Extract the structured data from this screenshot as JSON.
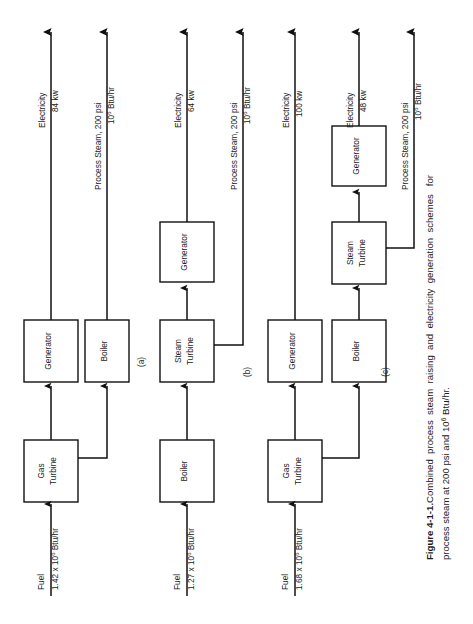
{
  "figure": {
    "number": "Figure 4-1-1.",
    "caption_line1": "Combined  process  steam  raising  and  electricity  generation  schemes   for",
    "caption_line2": "process steam at 200 psi and 10",
    "caption_line2_sup": "6",
    "caption_line2_tail": " Btu/hr.",
    "orientation": "rotated-90-ccw"
  },
  "schemes": [
    {
      "id": "a",
      "label": "(a)",
      "input": {
        "name": "Fuel",
        "value_pre": "1.42 x 10",
        "value_sup": "6",
        "value_post": " Btu/hr"
      },
      "blocks": [
        {
          "name": "gas-turbine",
          "line1": "Gas",
          "line2": "Turbine"
        },
        {
          "name": "generator",
          "line1": "Generator",
          "line2": ""
        },
        {
          "name": "boiler",
          "line1": "Boiler",
          "line2": ""
        }
      ],
      "outputs": [
        {
          "name": "electricity",
          "line1": "Electricity",
          "line2": "84  kw"
        },
        {
          "name": "process-steam",
          "line1": "Process  Steam,  200  psi",
          "line2_pre": "10",
          "line2_sup": "6",
          "line2_post": "  Btu/hr"
        }
      ]
    },
    {
      "id": "b",
      "label": "(b)",
      "input": {
        "name": "Fuel",
        "value_pre": "1.27 x 10",
        "value_sup": "6",
        "value_post": " Btu/hr"
      },
      "blocks": [
        {
          "name": "boiler",
          "line1": "Boiler",
          "line2": ""
        },
        {
          "name": "steam-turbine",
          "line1": "Steam",
          "line2": "Turbine"
        },
        {
          "name": "generator",
          "line1": "Generator",
          "line2": ""
        }
      ],
      "outputs": [
        {
          "name": "electricity",
          "line1": "Electricity",
          "line2": "64  kw"
        },
        {
          "name": "process-steam",
          "line1": "Process  Steam,  200  psi",
          "line2_pre": "10",
          "line2_sup": "6",
          "line2_post": "  Btu/hr"
        }
      ]
    },
    {
      "id": "c",
      "label": "(c)",
      "input": {
        "name": "Fuel",
        "value_pre": "1.68 x 10",
        "value_sup": "6",
        "value_post": " Btu/hr"
      },
      "blocks": [
        {
          "name": "gas-turbine",
          "line1": "Gas",
          "line2": "Turbine"
        },
        {
          "name": "generator-top",
          "line1": "Generator",
          "line2": ""
        },
        {
          "name": "boiler",
          "line1": "Boiler",
          "line2": ""
        },
        {
          "name": "steam-turbine",
          "line1": "Steam",
          "line2": "Turbine"
        },
        {
          "name": "generator-bottom",
          "line1": "Generator",
          "line2": ""
        }
      ],
      "outputs": [
        {
          "name": "electricity-gas",
          "line1": "Electricity",
          "line2": "100  kw"
        },
        {
          "name": "electricity-steam",
          "line1": "Electricity",
          "line2": "48  kw"
        },
        {
          "name": "process-steam",
          "line1": "Process  Steam,  200  psi",
          "line2_pre": "10",
          "line2_sup": "6",
          "line2_post": " Btu/hr"
        }
      ]
    }
  ],
  "colors": {
    "ink": "#1a1a1a",
    "paper": "#ffffff",
    "line": "#111111"
  }
}
